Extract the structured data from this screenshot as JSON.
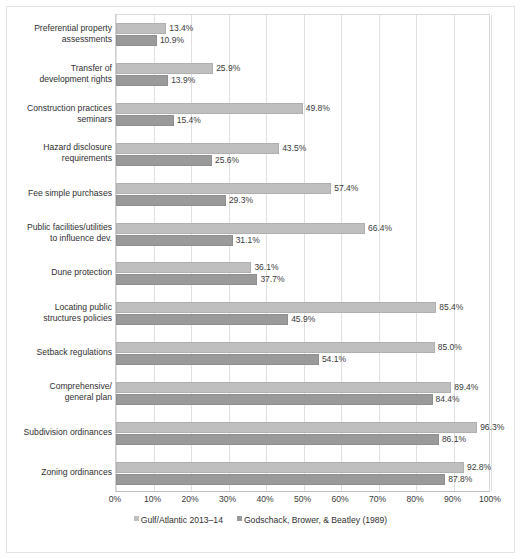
{
  "chart_data": {
    "type": "bar",
    "orientation": "horizontal",
    "title": "",
    "xlabel": "",
    "ylabel": "",
    "xlim": [
      0,
      100
    ],
    "xticks": [
      "0%",
      "10%",
      "20%",
      "30%",
      "40%",
      "50%",
      "60%",
      "70%",
      "80%",
      "90%",
      "100%"
    ],
    "grid": true,
    "legend_position": "bottom",
    "categories": [
      "Preferential property assessments",
      "Transfer of development rights",
      "Construction practices seminars",
      "Hazard disclosure requirements",
      "Fee simple purchases",
      "Public facilities/utilities to influence dev.",
      "Dune protection",
      "Locating public structures policies",
      "Setback regulations",
      "Comprehensive/ general plan",
      "Subdivision ordinances",
      "Zoning ordinances"
    ],
    "category_lines": [
      [
        "Preferential property",
        "assessments"
      ],
      [
        "Transfer of",
        "development rights"
      ],
      [
        "Construction practices",
        "seminars"
      ],
      [
        "Hazard disclosure",
        "requirements"
      ],
      [
        "Fee simple purchases"
      ],
      [
        "Public facilities/utilities",
        "to influence dev."
      ],
      [
        "Dune protection"
      ],
      [
        "Locating public",
        "structures policies"
      ],
      [
        "Setback regulations"
      ],
      [
        "Comprehensive/",
        "general plan"
      ],
      [
        "Subdivision ordinances"
      ],
      [
        "Zoning ordinances"
      ]
    ],
    "series": [
      {
        "name": "Gulf/Atlantic 2013–14",
        "color": "#bfbfbf",
        "values": [
          13.4,
          25.9,
          49.8,
          43.5,
          57.4,
          66.4,
          36.1,
          85.4,
          85.0,
          89.4,
          96.3,
          92.8
        ],
        "labels": [
          "13.4%",
          "25.9%",
          "49.8%",
          "43.5%",
          "57.4%",
          "66.4%",
          "36.1%",
          "85.4%",
          "85.0%",
          "89.4%",
          "96.3%",
          "92.8%"
        ]
      },
      {
        "name": "Godschack, Brower, & Beatley (1989)",
        "color": "#9a9a9a",
        "values": [
          10.9,
          13.9,
          15.4,
          25.6,
          29.3,
          31.1,
          37.7,
          45.9,
          54.1,
          84.4,
          86.1,
          87.8
        ],
        "labels": [
          "10.9%",
          "13.9%",
          "15.4%",
          "25.6%",
          "29.3%",
          "31.1%",
          "37.7%",
          "45.9%",
          "54.1%",
          "84.4%",
          "86.1%",
          "87.8%"
        ]
      }
    ]
  },
  "legend": {
    "items": [
      {
        "label": "Gulf/Atlantic 2013–14",
        "color": "#bfbfbf"
      },
      {
        "label": "Godschack, Brower, & Beatley (1989)",
        "color": "#9a9a9a"
      }
    ]
  }
}
